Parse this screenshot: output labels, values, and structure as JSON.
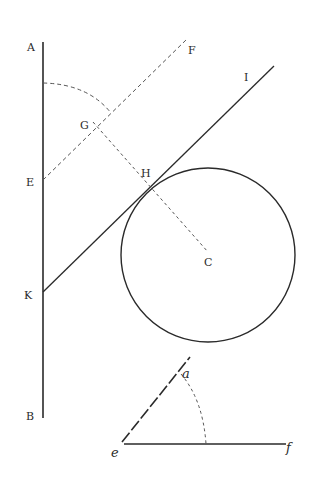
{
  "figure": {
    "type": "geometric-construction",
    "stroke_color": "#2a2a2a",
    "dash_color": "#555555",
    "labels": {
      "A": "A",
      "B": "B",
      "E": "E",
      "F": "F",
      "G": "G",
      "H": "H",
      "I": "I",
      "K": "K",
      "C": "C",
      "a": "a",
      "e": "e",
      "f": "f"
    },
    "lines": [
      {
        "name": "AB",
        "style": "solid",
        "from": [
          43,
          42
        ],
        "to": [
          43,
          418
        ]
      },
      {
        "name": "KI",
        "style": "solid",
        "from": [
          43,
          292
        ],
        "to": [
          274,
          66
        ]
      },
      {
        "name": "EF",
        "style": "dashed",
        "from": [
          43,
          180
        ],
        "to": [
          186,
          40
        ]
      },
      {
        "name": "GC",
        "style": "dashed",
        "from": [
          95,
          122
        ],
        "to": [
          208,
          252
        ]
      },
      {
        "name": "ef",
        "style": "solid",
        "from": [
          122,
          444
        ],
        "to": [
          286,
          444
        ]
      },
      {
        "name": "ea",
        "style": "solid",
        "from": [
          122,
          444
        ],
        "to": [
          190,
          356
        ]
      }
    ],
    "circle": {
      "center": [
        208,
        255
      ],
      "radius": 87
    },
    "arcs": [
      {
        "name": "arc-A-G",
        "style": "dashed"
      },
      {
        "name": "arc-a-f",
        "style": "dashed"
      }
    ]
  }
}
